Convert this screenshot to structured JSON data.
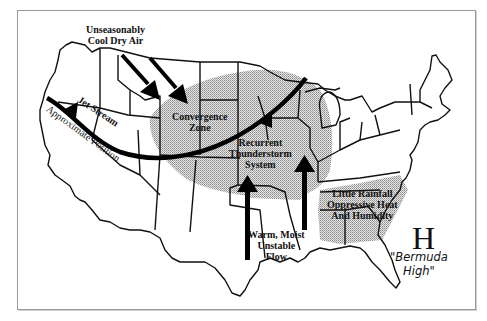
{
  "map": {
    "title": "US weather pattern: jet stream, convergence zone and Bermuda High",
    "labels": {
      "cool_air": [
        "Unseasonably",
        "Cool Dry Air"
      ],
      "jet_stream": "Jet Stream",
      "jet_position": "Approximate Position",
      "convergence": [
        "Convergence",
        "Zone"
      ],
      "thunderstorm": [
        "Recurrent",
        "Thunderstorm",
        "System"
      ],
      "warm_flow": [
        "Warm, Moist",
        "Unstable",
        "Flow"
      ],
      "southeast": [
        "Little Rainfall",
        "Oppressive Heat",
        "And Humidity"
      ],
      "high_symbol": "H",
      "high_name": [
        "\"Bermuda",
        "High\""
      ]
    },
    "colors": {
      "outline": "#111111",
      "shading": "#bdbdbd",
      "frame": "#9a9a9a",
      "arrow": "#000000"
    }
  }
}
